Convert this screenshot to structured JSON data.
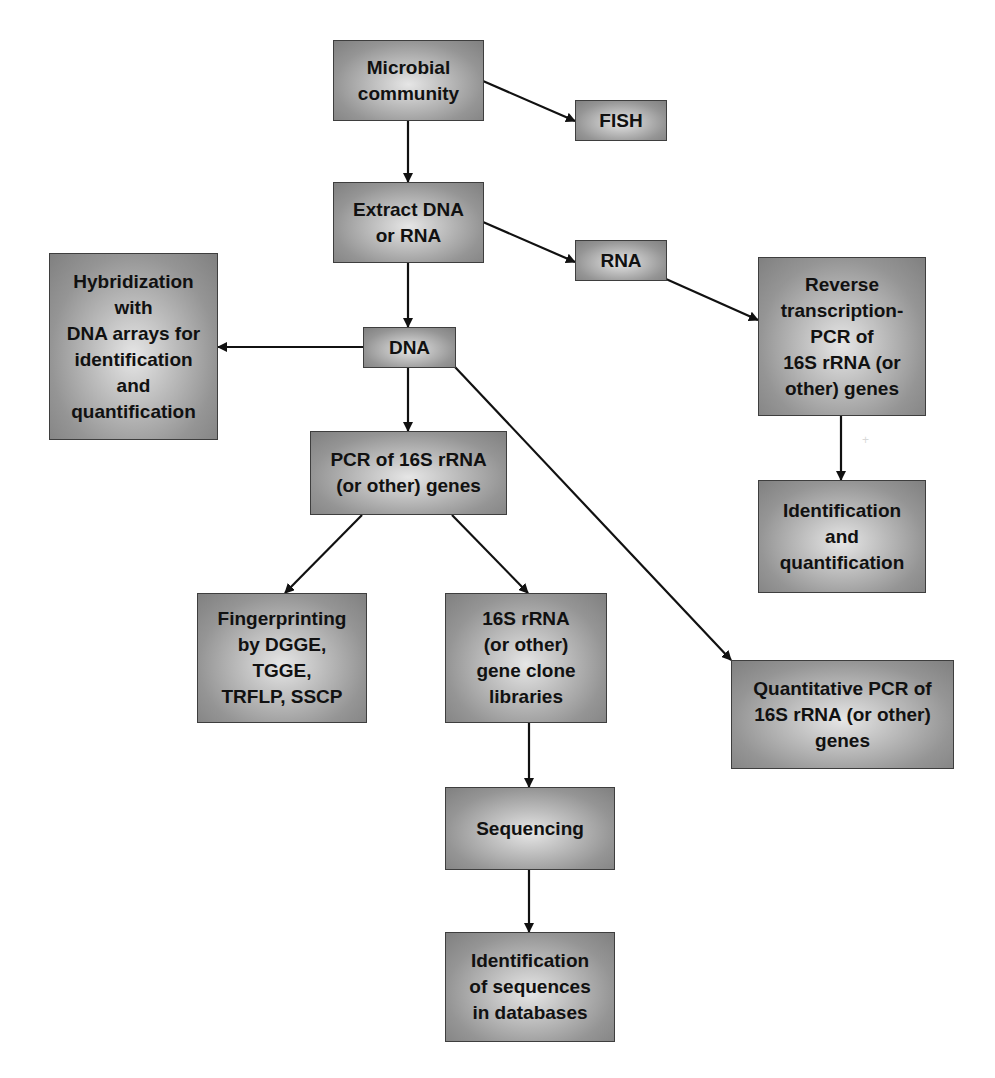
{
  "figure": {
    "colors": {
      "box_fill_center": "#e6e6e6",
      "box_fill_edge": "#808080",
      "box_border": "#3e3e3e",
      "arrow": "#111111",
      "text": "#111111"
    }
  },
  "nodes": [
    {
      "id": "microbial-community",
      "label": "Microbial\ncommunity"
    },
    {
      "id": "fish",
      "label": "FISH"
    },
    {
      "id": "extract",
      "label": "Extract DNA\nor RNA"
    },
    {
      "id": "rna",
      "label": "RNA"
    },
    {
      "id": "dna",
      "label": "DNA"
    },
    {
      "id": "hybridization",
      "label": "Hybridization\nwith\nDNA arrays for\nidentification\nand\nquantification"
    },
    {
      "id": "rt-pcr",
      "label": "Reverse\ntranscription-\nPCR of\n16S rRNA (or\nother) genes"
    },
    {
      "id": "pcr",
      "label": "PCR of 16S rRNA\n(or other) genes"
    },
    {
      "id": "id-quant",
      "label": "Identification\nand\nquantification"
    },
    {
      "id": "fingerprinting",
      "label": "Fingerprinting\nby DGGE,\nTGGE,\nTRFLP, SSCP"
    },
    {
      "id": "clone-libraries",
      "label": "16S rRNA\n(or other)\ngene clone\nlibraries"
    },
    {
      "id": "qpcr",
      "label": "Quantitative PCR of\n16S rRNA (or other)\ngenes"
    },
    {
      "id": "sequencing",
      "label": "Sequencing"
    },
    {
      "id": "db-identification",
      "label": "Identification\nof sequences\nin databases"
    }
  ],
  "edges": [
    {
      "from": "microbial-community",
      "to": "fish"
    },
    {
      "from": "microbial-community",
      "to": "extract"
    },
    {
      "from": "extract",
      "to": "rna"
    },
    {
      "from": "extract",
      "to": "dna"
    },
    {
      "from": "rna",
      "to": "rt-pcr"
    },
    {
      "from": "dna",
      "to": "hybridization"
    },
    {
      "from": "dna",
      "to": "pcr"
    },
    {
      "from": "dna",
      "to": "qpcr"
    },
    {
      "from": "rt-pcr",
      "to": "id-quant"
    },
    {
      "from": "pcr",
      "to": "fingerprinting"
    },
    {
      "from": "pcr",
      "to": "clone-libraries"
    },
    {
      "from": "clone-libraries",
      "to": "sequencing"
    },
    {
      "from": "sequencing",
      "to": "db-identification"
    }
  ],
  "caption": ""
}
